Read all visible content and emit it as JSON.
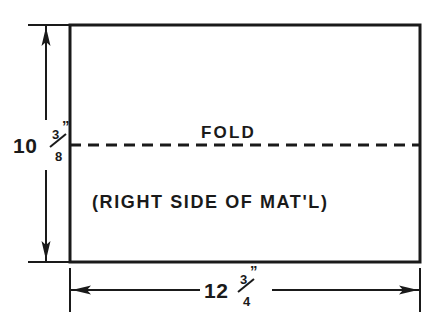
{
  "drawing": {
    "title": "Fold layout of rectangular material panel",
    "ink_color": "#1a1a1a",
    "background_color": "#ffffff",
    "labels": {
      "fold": "FOLD",
      "material_side": "(RIGHT SIDE OF MAT'L)"
    },
    "dimensions": {
      "height": {
        "whole": "10",
        "numerator": "3",
        "denominator": "8",
        "unit_mark": "”",
        "full_text": "10 3/8\"",
        "orientation": "vertical",
        "placement": "left"
      },
      "width": {
        "whole": "12",
        "numerator": "3",
        "denominator": "4",
        "unit_mark": "”",
        "full_text": "12 3/4\"",
        "orientation": "horizontal",
        "placement": "bottom"
      }
    }
  }
}
